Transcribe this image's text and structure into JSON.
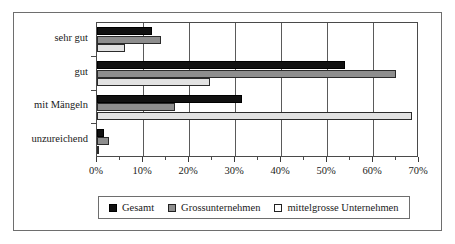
{
  "chart_data": {
    "type": "bar",
    "orientation": "horizontal",
    "title": "",
    "xlabel": "",
    "ylabel": "",
    "categories": [
      "sehr gut",
      "gut",
      "mit Mängeln",
      "unzureichend"
    ],
    "series": [
      {
        "name": "Gesamt",
        "color": "#111111",
        "values": [
          12.0,
          54.0,
          31.5,
          1.5
        ]
      },
      {
        "name": "Grossunternehmen",
        "color": "#8e8e8e",
        "values": [
          14.0,
          65.0,
          17.0,
          2.5
        ]
      },
      {
        "name": "mittelgrosse Unternehmen",
        "color": "#e2e2e2",
        "values": [
          6.0,
          24.5,
          68.5,
          0.3
        ]
      }
    ],
    "xlim": [
      0,
      70
    ],
    "xticks": [
      0,
      10,
      20,
      30,
      40,
      50,
      60,
      70
    ],
    "xtick_labels": [
      "0%",
      "10%",
      "20%",
      "30%",
      "40%",
      "50%",
      "60%",
      "70%"
    ],
    "xminor_step": 5,
    "grid": "vertical",
    "legend_position": "bottom"
  },
  "legend": {
    "entries": [
      {
        "label": "Gesamt",
        "swatch": "legend-swatch-gesamt"
      },
      {
        "label": "Grossunternehmen",
        "swatch": "legend-swatch-grossunternehmen"
      },
      {
        "label": "mittelgrosse Unternehmen",
        "swatch": "legend-swatch-mittelgrosse-unternehmen"
      }
    ]
  }
}
